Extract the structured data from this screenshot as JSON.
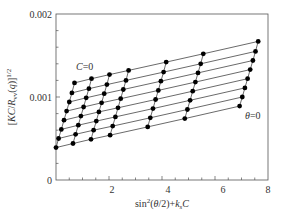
{
  "chart_data": {
    "type": "scatter",
    "title": "",
    "xlabel": "sin²(θ/2)+k_s C",
    "ylabel": "[KC/R_vv(q)]^1/2",
    "xlim": [
      0,
      8
    ],
    "ylim": [
      0,
      0.002
    ],
    "x_ticks": [
      {
        "value": 2,
        "label": "2"
      },
      {
        "value": 4,
        "label": "4"
      },
      {
        "value": 6,
        "label": "6"
      },
      {
        "value": 8,
        "label": "8"
      }
    ],
    "y_ticks": [
      {
        "value": 0,
        "label": "0"
      },
      {
        "value": 0.001,
        "label": "0.001"
      },
      {
        "value": 0.002,
        "label": "0.002"
      }
    ],
    "grid": false,
    "legend": null,
    "annotations": [
      {
        "text": "C=0",
        "x": 1.25,
        "y": 0.00134
      },
      {
        "text": "θ=0",
        "x": 6.8,
        "y": 0.00078
      }
    ],
    "grid_description": "Zimm-type grid: 7 steep constant-concentration lines crossed by 8 shallow constant-angle lines; the leftmost steep line is the C=0 extrapolation and the lowest shallow line is the θ=0 extrapolation",
    "origin": {
      "x": 0.0,
      "y": 0.00039
    },
    "column_step": [
      {
        "dx": 0.64,
        "dy": 4.8e-05
      },
      {
        "dx": 0.68,
        "dy": 4.8e-05
      },
      {
        "dx": 0.72,
        "dy": 5.5e-05
      },
      {
        "dx": 1.42,
        "dy": 0.0001
      },
      {
        "dx": 1.4,
        "dy": 0.0001
      },
      {
        "dx": 2.07,
        "dy": 0.000145
      }
    ],
    "row_step": {
      "dx": 0.1,
      "dy": 0.000111
    },
    "rows": 8,
    "columns": 7,
    "series": [
      {
        "name": "row-0 (θ=0)",
        "x": [
          0.0,
          0.64,
          1.32,
          2.04,
          3.46,
          4.86,
          6.93
        ],
        "y": [
          0.00039,
          0.00044,
          0.00049,
          0.00054,
          0.00064,
          0.00074,
          0.00089
        ]
      },
      {
        "name": "row-1",
        "x": [
          0.1,
          0.74,
          1.42,
          2.14,
          3.56,
          4.96,
          7.03
        ],
        "y": [
          0.0005,
          0.00055,
          0.0006,
          0.00065,
          0.00075,
          0.00085,
          0.001
        ]
      },
      {
        "name": "row-2",
        "x": [
          0.2,
          0.84,
          1.52,
          2.24,
          3.66,
          5.06,
          7.13
        ],
        "y": [
          0.00061,
          0.00066,
          0.00071,
          0.00076,
          0.00086,
          0.00096,
          0.00111
        ]
      },
      {
        "name": "row-3",
        "x": [
          0.3,
          0.94,
          1.62,
          2.34,
          3.76,
          5.16,
          7.23
        ],
        "y": [
          0.00072,
          0.00077,
          0.00082,
          0.00087,
          0.00097,
          0.00107,
          0.00122
        ]
      },
      {
        "name": "row-4",
        "x": [
          0.4,
          1.04,
          1.72,
          2.44,
          3.86,
          5.26,
          7.33
        ],
        "y": [
          0.00083,
          0.00088,
          0.00093,
          0.00098,
          0.00108,
          0.00118,
          0.00133
        ]
      },
      {
        "name": "row-5",
        "x": [
          0.5,
          1.14,
          1.82,
          2.54,
          3.96,
          5.36,
          7.43
        ],
        "y": [
          0.00094,
          0.00099,
          0.00104,
          0.00109,
          0.00119,
          0.00129,
          0.00144
        ]
      },
      {
        "name": "row-6",
        "x": [
          0.6,
          1.24,
          1.92,
          2.64,
          4.06,
          5.46,
          7.53
        ],
        "y": [
          0.00105,
          0.0011,
          0.00115,
          0.0012,
          0.0013,
          0.0014,
          0.00155
        ]
      },
      {
        "name": "row-7",
        "x": [
          0.7,
          1.34,
          2.02,
          2.74,
          4.16,
          5.56,
          7.63
        ],
        "y": [
          0.00117,
          0.00122,
          0.00127,
          0.00132,
          0.00142,
          0.00152,
          0.00167
        ]
      }
    ]
  },
  "labels": {
    "y_tick_0": "0",
    "y_tick_1": "0.001",
    "y_tick_2": "0.002",
    "x_tick_2": "2",
    "x_tick_4": "4",
    "x_tick_6": "6",
    "x_tick_8": "8",
    "c_zero": "C=0",
    "theta_zero": "θ=0"
  },
  "colors": {
    "axis": "#555555",
    "line": "#444444",
    "marker": "#000000"
  }
}
